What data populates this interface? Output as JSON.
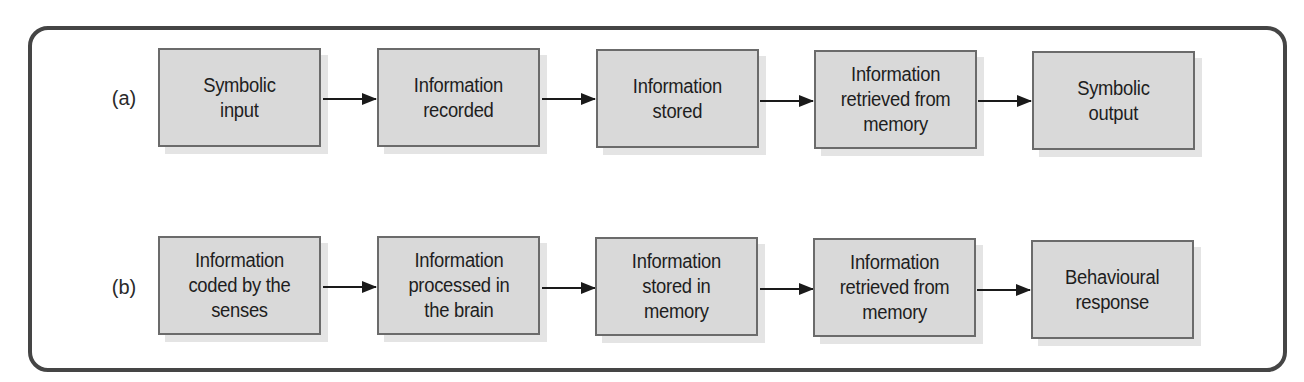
{
  "diagram": {
    "type": "flowchart",
    "colors": {
      "frame_border": "#454545",
      "box_fill": "#d9d9d9",
      "box_border": "#6b6b6b",
      "box_shadow": "#e4e4e4",
      "arrow": "#1a1a1a",
      "text": "#1e1e1e"
    },
    "rows": [
      {
        "label": "(a)",
        "steps": [
          {
            "text": "Symbolic\ninput"
          },
          {
            "text": "Information\nrecorded"
          },
          {
            "text": "Information\nstored"
          },
          {
            "text": "Information\nretrieved from\nmemory"
          },
          {
            "text": "Symbolic\noutput"
          }
        ]
      },
      {
        "label": "(b)",
        "steps": [
          {
            "text": "Information\ncoded by the\nsenses"
          },
          {
            "text": "Information\nprocessed in\nthe brain"
          },
          {
            "text": "Information\nstored in\nmemory"
          },
          {
            "text": "Information\nretrieved from\nmemory"
          },
          {
            "text": "Behavioural\nresponse"
          }
        ]
      }
    ]
  }
}
